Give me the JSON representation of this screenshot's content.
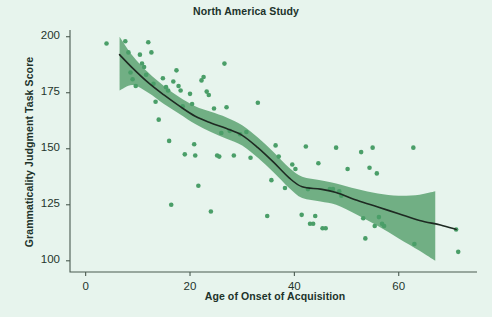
{
  "chart_data": {
    "type": "scatter",
    "title": "North America Study",
    "xlabel": "Age of Onset of Acquisition",
    "ylabel": "Grammaticality Judgment Task Score",
    "xlim": [
      -3,
      75
    ],
    "ylim": [
      95,
      203
    ],
    "xticks": [
      0,
      20,
      40,
      60
    ],
    "yticks": [
      100,
      125,
      150,
      175,
      200
    ],
    "grid": false,
    "legend": null,
    "colors": {
      "background": "#e7f4ed",
      "point": "#4a9e68",
      "band": "#6aab7e",
      "trendline": "#1e2a22",
      "axis": "#4a5a50",
      "text": "#20322a"
    },
    "series": [
      {
        "name": "Participants",
        "marker": "circle",
        "points": [
          [
            4.0,
            197.0
          ],
          [
            7.6,
            198.0
          ],
          [
            8.2,
            193.0
          ],
          [
            8.6,
            184.0
          ],
          [
            9.0,
            181.0
          ],
          [
            9.6,
            178.0
          ],
          [
            10.4,
            192.0
          ],
          [
            10.8,
            188.0
          ],
          [
            11.2,
            186.5
          ],
          [
            11.6,
            183.0
          ],
          [
            12.0,
            197.5
          ],
          [
            12.6,
            193.0
          ],
          [
            13.0,
            179.0
          ],
          [
            13.4,
            171.0
          ],
          [
            14.0,
            163.0
          ],
          [
            14.8,
            181.5
          ],
          [
            15.4,
            177.5
          ],
          [
            15.8,
            176.0
          ],
          [
            16.0,
            153.5
          ],
          [
            16.4,
            125.0
          ],
          [
            16.8,
            180.0
          ],
          [
            17.4,
            185.0
          ],
          [
            17.8,
            178.0
          ],
          [
            18.2,
            176.0
          ],
          [
            18.6,
            169.0
          ],
          [
            19.0,
            147.5
          ],
          [
            20.0,
            174.5
          ],
          [
            20.4,
            170.0
          ],
          [
            20.8,
            152.0
          ],
          [
            21.0,
            147.0
          ],
          [
            21.6,
            133.5
          ],
          [
            22.2,
            180.5
          ],
          [
            22.6,
            182.0
          ],
          [
            23.2,
            175.5
          ],
          [
            23.6,
            174.0
          ],
          [
            24.0,
            122.0
          ],
          [
            24.6,
            168.0
          ],
          [
            25.2,
            147.0
          ],
          [
            25.6,
            146.5
          ],
          [
            26.0,
            157.0
          ],
          [
            26.6,
            188.0
          ],
          [
            27.0,
            168.5
          ],
          [
            27.6,
            158.0
          ],
          [
            28.4,
            147.0
          ],
          [
            29.6,
            156.5
          ],
          [
            30.8,
            157.5
          ],
          [
            31.6,
            146.0
          ],
          [
            33.0,
            170.5
          ],
          [
            34.8,
            120.0
          ],
          [
            35.6,
            136.0
          ],
          [
            36.4,
            151.5
          ],
          [
            37.0,
            146.5
          ],
          [
            38.2,
            132.5
          ],
          [
            39.6,
            143.0
          ],
          [
            40.2,
            141.0
          ],
          [
            41.4,
            120.5
          ],
          [
            42.2,
            151.0
          ],
          [
            42.6,
            132.0
          ],
          [
            43.0,
            116.5
          ],
          [
            43.6,
            116.5
          ],
          [
            44.0,
            120.0
          ],
          [
            44.6,
            143.5
          ],
          [
            45.4,
            114.5
          ],
          [
            46.0,
            114.5
          ],
          [
            46.8,
            132.0
          ],
          [
            47.4,
            132.0
          ],
          [
            48.0,
            150.5
          ],
          [
            48.6,
            131.0
          ],
          [
            49.0,
            129.0
          ],
          [
            50.2,
            141.0
          ],
          [
            52.8,
            148.5
          ],
          [
            53.2,
            119.0
          ],
          [
            53.6,
            110.0
          ],
          [
            54.4,
            141.5
          ],
          [
            55.0,
            150.5
          ],
          [
            55.4,
            115.5
          ],
          [
            55.8,
            139.0
          ],
          [
            56.2,
            119.5
          ],
          [
            56.8,
            116.5
          ],
          [
            57.2,
            115.5
          ],
          [
            62.8,
            150.5
          ],
          [
            63.0,
            107.5
          ],
          [
            71.0,
            114.0
          ],
          [
            71.4,
            104.0
          ]
        ]
      }
    ],
    "trendline": {
      "name": "Fitted curve",
      "points": [
        [
          6.5,
          192.0
        ],
        [
          9.0,
          186.0
        ],
        [
          12.0,
          179.5
        ],
        [
          15.0,
          174.0
        ],
        [
          18.0,
          169.0
        ],
        [
          21.0,
          164.5
        ],
        [
          24.0,
          161.5
        ],
        [
          27.0,
          159.0
        ],
        [
          30.0,
          156.0
        ],
        [
          33.0,
          150.5
        ],
        [
          36.0,
          144.0
        ],
        [
          39.0,
          137.0
        ],
        [
          41.5,
          133.0
        ],
        [
          45.0,
          132.0
        ],
        [
          48.0,
          130.5
        ],
        [
          52.0,
          127.0
        ],
        [
          56.0,
          124.0
        ],
        [
          60.0,
          121.0
        ],
        [
          64.0,
          118.0
        ],
        [
          68.0,
          116.0
        ],
        [
          71.0,
          114.0
        ]
      ]
    },
    "confidence_band": {
      "name": "Confidence interval",
      "upper": [
        [
          6.5,
          200.0
        ],
        [
          9.0,
          191.5
        ],
        [
          12.0,
          184.0
        ],
        [
          15.0,
          178.0
        ],
        [
          18.0,
          173.0
        ],
        [
          21.0,
          169.0
        ],
        [
          24.0,
          166.5
        ],
        [
          27.0,
          164.0
        ],
        [
          30.0,
          160.5
        ],
        [
          33.0,
          155.0
        ],
        [
          36.0,
          148.5
        ],
        [
          39.0,
          141.5
        ],
        [
          41.5,
          137.5
        ],
        [
          45.0,
          136.0
        ],
        [
          48.0,
          134.5
        ],
        [
          52.0,
          132.0
        ],
        [
          56.0,
          130.0
        ],
        [
          60.0,
          129.0
        ],
        [
          64.0,
          129.5
        ],
        [
          67.0,
          131.0
        ]
      ],
      "lower": [
        [
          6.5,
          176.0
        ],
        [
          9.0,
          178.5
        ],
        [
          12.0,
          175.0
        ],
        [
          15.0,
          170.0
        ],
        [
          18.0,
          165.5
        ],
        [
          21.0,
          161.0
        ],
        [
          24.0,
          157.5
        ],
        [
          27.0,
          154.5
        ],
        [
          30.0,
          151.5
        ],
        [
          33.0,
          146.0
        ],
        [
          36.0,
          139.5
        ],
        [
          39.0,
          132.5
        ],
        [
          41.5,
          128.0
        ],
        [
          45.0,
          126.5
        ],
        [
          48.0,
          125.0
        ],
        [
          52.0,
          120.5
        ],
        [
          56.0,
          115.5
        ],
        [
          60.0,
          110.0
        ],
        [
          64.0,
          104.5
        ],
        [
          67.0,
          100.0
        ]
      ]
    }
  }
}
